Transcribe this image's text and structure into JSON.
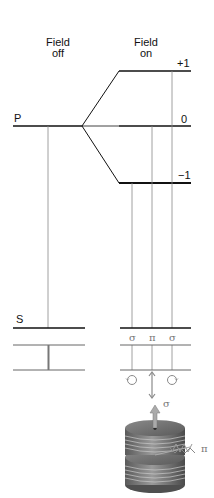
{
  "diagram": {
    "columns": {
      "field_off": {
        "line1": "Field",
        "line2": "off"
      },
      "field_on": {
        "line1": "Field",
        "line2": "on"
      }
    },
    "levels": {
      "P": "P",
      "S": "S",
      "m_plus": "+1",
      "m_zero": "0",
      "m_minus": "−1"
    },
    "transitions": {
      "left": "σ",
      "center": "π",
      "right": "σ"
    },
    "polarization": {
      "sigma_label": "σ",
      "pi_label": "π"
    },
    "colors": {
      "level_line": "#111111",
      "transition_line": "#888888",
      "arrow": "#8a8a8a",
      "magnet": "#6e6e6e"
    }
  }
}
